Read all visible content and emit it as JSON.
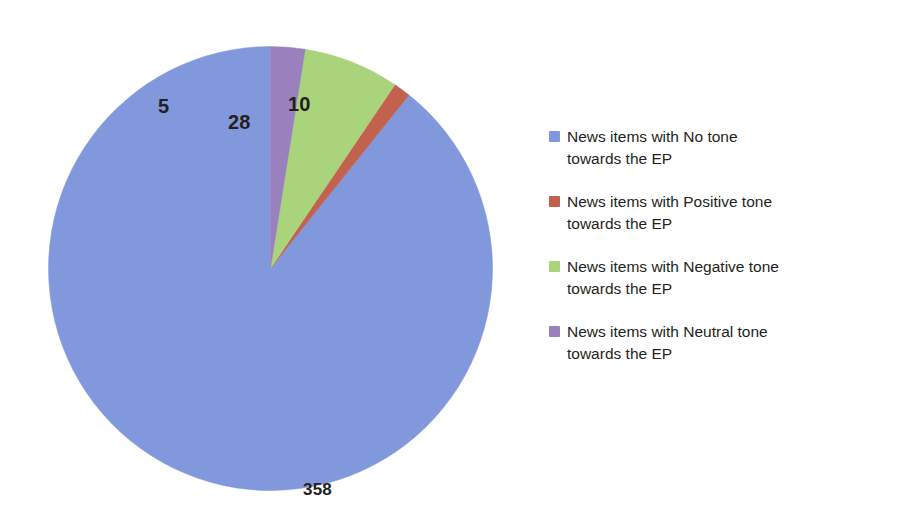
{
  "chart_data": {
    "type": "pie",
    "title": "",
    "subtitle": "",
    "xlabel": "",
    "ylabel": "",
    "total": 401,
    "grid": false,
    "legend_position": "right",
    "data_labels_shown": true,
    "categories": [
      "News items with No tone towards the EP",
      "News items with Positive tone towards the EP",
      "News items with Negative tone towards the EP",
      "News items with Neutral tone towards the EP"
    ],
    "values": [
      358,
      5,
      28,
      10
    ],
    "colors": [
      "#8198dd",
      "#c2624e",
      "#a9d47c",
      "#9b80be"
    ],
    "slices": [
      {
        "name": "News items with No tone towards the EP",
        "short_name": "No tone",
        "value": 358,
        "label": "358",
        "color": "#8198dd",
        "percent": 89.3,
        "start_angle_deg": 0,
        "sweep_deg": 321.4
      },
      {
        "name": "News items with Positive tone towards the EP",
        "short_name": "Positive tone",
        "value": 5,
        "label": "5",
        "color": "#c2624e",
        "percent": 1.2,
        "start_angle_deg": 321.4,
        "sweep_deg": 4.5
      },
      {
        "name": "News items with Negative tone towards the EP",
        "short_name": "Negative tone",
        "value": 28,
        "label": "28",
        "color": "#a9d47c",
        "percent": 7.0,
        "start_angle_deg": 325.9,
        "sweep_deg": 25.1
      },
      {
        "name": "News items with Neutral tone towards the EP",
        "short_name": "Neutral tone",
        "value": 10,
        "label": "10",
        "color": "#9b80be",
        "percent": 2.5,
        "start_angle_deg": 351.0,
        "sweep_deg": 9.0
      }
    ]
  },
  "pie": {
    "center_x": 222.5,
    "center_y": 222.5,
    "radius": 222,
    "direction": "counter-clockwise",
    "start_at_12_oclock": true,
    "labels": {
      "no_tone": "358",
      "positive": "5",
      "negative": "28",
      "neutral": "10"
    }
  },
  "legend": {
    "items": [
      {
        "line1": "News items with No tone",
        "line2": "towards the EP",
        "color": "#8198dd",
        "swatch_name": "legend-swatch-no-tone"
      },
      {
        "line1": "News items with Positive tone",
        "line2": "towards the EP",
        "color": "#c2624e",
        "swatch_name": "legend-swatch-positive-tone"
      },
      {
        "line1": "News items with Negative tone",
        "line2": "towards the EP",
        "color": "#a9d47c",
        "swatch_name": "legend-swatch-negative-tone"
      },
      {
        "line1": "News items with Neutral tone",
        "line2": "towards the EP",
        "color": "#9b80be",
        "swatch_name": "legend-swatch-neutral-tone"
      }
    ]
  }
}
